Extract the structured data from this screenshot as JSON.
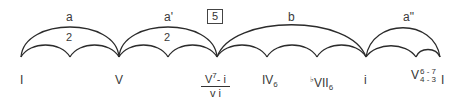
{
  "diagram": {
    "type": "form-arc-diagram",
    "box_label": "5",
    "sections": [
      {
        "id": "a",
        "label": "a",
        "count": "2",
        "from": "I",
        "to": "V"
      },
      {
        "id": "a1",
        "label": "a'",
        "count": "2",
        "from": "V",
        "to": "V7-i / vi"
      },
      {
        "id": "b",
        "label": "b",
        "count": "",
        "from": "V7-i / vi",
        "to": "i"
      },
      {
        "id": "a2",
        "label": "a\"",
        "count": "",
        "from": "i",
        "to": "I"
      }
    ],
    "chords": {
      "c1": "I",
      "c2": "V",
      "c3_top_base": "V",
      "c3_top_sup": "7",
      "c3_top_rest": "- i",
      "c3_bottom": "v i",
      "c4_base": "IV",
      "c4_sub": "6",
      "c5_flat": "♭",
      "c5_base": "VII",
      "c5_sub": "6",
      "c6": "i",
      "c7_base": "V",
      "c7_fig_top": "6 - 7",
      "c7_fig_bottom": "4 - 3",
      "c8": "I"
    },
    "stroke_color": "#2b2b2b"
  }
}
